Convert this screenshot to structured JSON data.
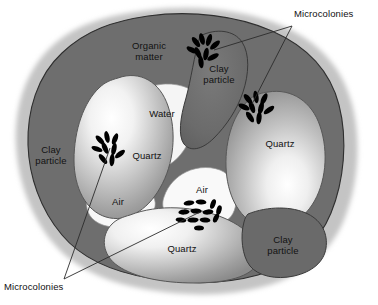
{
  "figure": {
    "domain": "diagram",
    "background_color": "#ffffff"
  },
  "palette": {
    "halo": "#c9c9c9",
    "matrix_dark": "#6e6e6e",
    "matrix_outline": "#2b2b2b",
    "quartz_light": "#ffffff",
    "quartz_mid": "#b5b5b5",
    "quartz_dark": "#8a8a8a",
    "pore_white": "#f2f2f2",
    "microcolony": "#000000",
    "leader_line": "#2b2b2b",
    "label_text": "#111111"
  },
  "labels": {
    "organic_matter": "Organic\nmatter",
    "clay_particle_top": "Clay\nparticle",
    "clay_particle_left": "Clay\nparticle",
    "clay_particle_bottom_right": "Clay\nparticle",
    "water": "Water",
    "air_center": "Air",
    "air_left": "Air",
    "quartz_left": "Quartz",
    "quartz_right": "Quartz",
    "quartz_bottom": "Quartz",
    "microcolonies_top_right": "Microcolonies",
    "microcolonies_bottom_left": "Microcolonies"
  },
  "callouts": [
    {
      "name": "microcolonies-top-right",
      "text": "Microcolonies",
      "vertex": [
        292,
        26
      ],
      "targets": [
        [
          214,
          50
        ],
        [
          252,
          104
        ]
      ]
    },
    {
      "name": "microcolonies-bottom-left",
      "text": "Microcolonies",
      "vertex": [
        64,
        279
      ],
      "targets": [
        [
          110,
          148
        ],
        [
          200,
          212
        ]
      ]
    }
  ],
  "microcolonies": [
    {
      "name": "microcolony-clay-top",
      "center": [
        205,
        52
      ],
      "style": "radiating",
      "count": 9
    },
    {
      "name": "microcolony-quartz-right",
      "center": [
        258,
        108
      ],
      "style": "radiating",
      "count": 9
    },
    {
      "name": "microcolony-quartz-left",
      "center": [
        110,
        150
      ],
      "style": "radiating",
      "count": 9
    },
    {
      "name": "microcolony-air-center",
      "center": [
        204,
        212
      ],
      "style": "packed",
      "count": 12
    }
  ],
  "regions": [
    {
      "name": "organic-matter",
      "kind": "matrix",
      "label": "Organic matter"
    },
    {
      "name": "clay-particle-top",
      "kind": "matrix",
      "label": "Clay particle"
    },
    {
      "name": "clay-particle-left",
      "kind": "matrix",
      "label": "Clay particle"
    },
    {
      "name": "clay-particle-bottom-right",
      "kind": "matrix",
      "label": "Clay particle"
    },
    {
      "name": "quartz-grain-left",
      "kind": "quartz",
      "label": "Quartz"
    },
    {
      "name": "quartz-grain-right",
      "kind": "quartz",
      "label": "Quartz"
    },
    {
      "name": "quartz-grain-bottom",
      "kind": "quartz",
      "label": "Quartz"
    },
    {
      "name": "water-pore",
      "kind": "pore",
      "label": "Water"
    },
    {
      "name": "air-pore-center",
      "kind": "pore",
      "label": "Air"
    },
    {
      "name": "air-pore-left",
      "kind": "pore",
      "label": "Air"
    }
  ]
}
